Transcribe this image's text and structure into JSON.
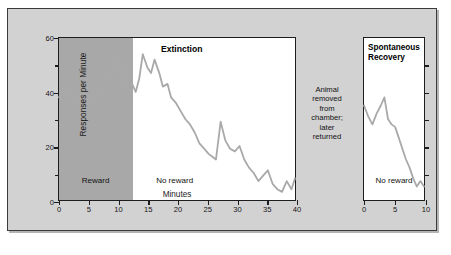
{
  "figure": {
    "background_color": "#d2d2d2",
    "frame_border_color": "#3b3b3b",
    "line_color": "#a9a9a9",
    "reward_band_color": "#a8a8a8"
  },
  "left_panel": {
    "extinction_title": "Extinction",
    "reward_label": "Reward",
    "no_reward_label": "No reward",
    "ylabel": "Responses per Minute",
    "xlabel": "Minutes",
    "ytick_labels": [
      "0",
      "20",
      "40",
      "60"
    ],
    "xtick_labels": [
      "0",
      "5",
      "10",
      "15",
      "20",
      "25",
      "30",
      "35",
      "40"
    ]
  },
  "annotation": {
    "line1": "Animal",
    "line2": "removed",
    "line3": "from",
    "line4": "chamber;",
    "line5": "later",
    "line6": "returned"
  },
  "right_panel": {
    "title_line1": "Spontaneous",
    "title_line2": "Recovery",
    "no_reward_label": "No reward",
    "xtick_labels": [
      "0",
      "5",
      "10"
    ]
  },
  "chart_data": {
    "type": "line",
    "panels": [
      {
        "name": "extinction-panel",
        "title": "Extinction",
        "xlabel": "Minutes",
        "ylabel": "Responses per Minute",
        "xlim": [
          0,
          40
        ],
        "ylim": [
          0,
          60
        ],
        "xticks": [
          0,
          5,
          10,
          15,
          20,
          25,
          30,
          35,
          40
        ],
        "yticks": [
          0,
          10,
          20,
          30,
          40,
          50,
          60
        ],
        "ytick_labels_major": [
          0,
          20,
          40,
          60
        ],
        "grid": false,
        "legend": "none",
        "shaded_regions": [
          {
            "label": "Reward",
            "x_start": 0,
            "x_end": 12.5,
            "color": "#a8a8a8"
          },
          {
            "label": "No reward",
            "x_start": 12.5,
            "x_end": 40,
            "color": "#ffffff"
          }
        ],
        "series": [
          {
            "name": "Responses per minute",
            "x": [
              0,
              1,
              2,
              3,
              4,
              5,
              6,
              7,
              8,
              9,
              10,
              10.6,
              11.2,
              11.8,
              12.4,
              13,
              13.6,
              14.2,
              15,
              15.6,
              16.2,
              17,
              17.6,
              18.4,
              19,
              19.8,
              20.6,
              21.4,
              22.2,
              23,
              23.8,
              24.6,
              25.4,
              26,
              26.6,
              27.4,
              28.2,
              29,
              29.8,
              30.6,
              31.4,
              32.2,
              33,
              33.8,
              34.6,
              35.4,
              36.2,
              37,
              37.8,
              38.6,
              39.4,
              40
            ],
            "y": [
              38,
              41,
              38,
              35,
              34,
              34,
              37,
              40,
              44,
              47,
              52,
              47,
              51,
              38,
              43,
              40,
              45,
              54,
              49,
              47,
              52,
              47,
              42,
              43,
              38,
              36,
              33,
              30,
              28,
              25,
              21,
              19,
              17,
              16,
              15,
              29,
              22,
              19,
              18,
              20,
              15,
              12,
              10,
              7,
              9,
              11,
              6,
              4,
              3,
              7,
              4,
              8
            ]
          }
        ]
      },
      {
        "name": "spontaneous-recovery-panel",
        "title": "Spontaneous Recovery",
        "xlabel": "",
        "ylabel": "",
        "xlim": [
          0,
          10
        ],
        "ylim": [
          0,
          60
        ],
        "xticks": [
          0,
          5,
          10
        ],
        "yticks": [
          0,
          10,
          20,
          30,
          40,
          50
        ],
        "grid": false,
        "legend": "none",
        "shaded_regions": [
          {
            "label": "No reward",
            "x_start": 0,
            "x_end": 10,
            "color": "#ffffff"
          }
        ],
        "series": [
          {
            "name": "Responses per minute",
            "x": [
              0,
              0.7,
              1.4,
              2.1,
              2.8,
              3.4,
              4.0,
              4.6,
              5.2,
              5.8,
              6.4,
              7.0,
              7.6,
              8.2,
              8.8,
              9.4,
              10
            ],
            "y": [
              35,
              31,
              28,
              32,
              35,
              38,
              30,
              28,
              27,
              23,
              19,
              15,
              12,
              8,
              5,
              7,
              5
            ]
          }
        ]
      }
    ]
  }
}
